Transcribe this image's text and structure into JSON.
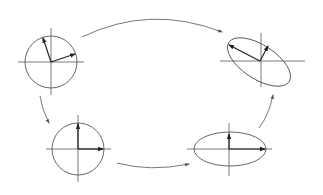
{
  "diagram": {
    "type": "svd-transformation-cycle",
    "colors": {
      "lines": "#555555",
      "vectors": "#222222",
      "background": "#ffffff"
    },
    "panels": [
      {
        "id": "top-left",
        "shape": "circle",
        "description": "unit circle with two rotated orthogonal vectors",
        "center": [
          51,
          62
        ]
      },
      {
        "id": "top-right",
        "shape": "rotated-ellipse",
        "description": "tilted ellipse with two transformed vectors",
        "center": [
          260,
          61
        ]
      },
      {
        "id": "bottom-left",
        "shape": "circle",
        "description": "unit circle with axis-aligned vectors",
        "center": [
          78,
          148
        ]
      },
      {
        "id": "bottom-right",
        "shape": "ellipse",
        "description": "axis-aligned ellipse with stretched vectors",
        "center": [
          229,
          149
        ]
      }
    ],
    "arrows": [
      {
        "from": "top-left",
        "to": "top-right"
      },
      {
        "from": "top-left",
        "to": "bottom-left"
      },
      {
        "from": "bottom-left",
        "to": "bottom-right"
      },
      {
        "from": "bottom-right",
        "to": "top-right"
      }
    ]
  }
}
